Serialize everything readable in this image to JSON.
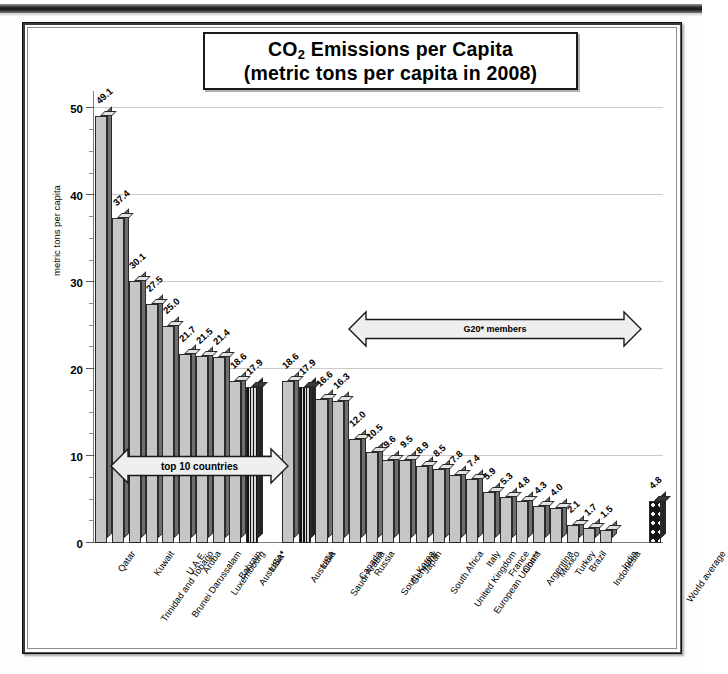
{
  "title": {
    "line1_prefix": "CO",
    "line1_sub": "2",
    "line1_suffix": " Emissions per Capita",
    "line2": "(metric tons per capita in 2008)"
  },
  "axis": {
    "y_title": "metric tons per capita",
    "y_ticks": [
      "0",
      "10",
      "20",
      "30",
      "40",
      "50"
    ]
  },
  "annotations": [
    {
      "id": "top10",
      "label": "top 10 countries"
    },
    {
      "id": "g20",
      "label": "G20* members"
    }
  ],
  "chart_data": {
    "type": "bar",
    "title": "CO2 Emissions per Capita (metric tons per capita in 2008)",
    "xlabel": "",
    "ylabel": "metric tons per capita",
    "ylim": [
      0,
      52
    ],
    "ytick_step": 10,
    "grid": true,
    "legend": "none",
    "groups": [
      {
        "name": "top 10 countries",
        "categories": [
          "Qatar",
          "Trinidad and Tobago",
          "Kuwait",
          "Brunei Darussalam",
          "U.A.E.",
          "Aruba",
          "Luxembourg",
          "Bahrain",
          "Australia*",
          "USA*"
        ],
        "values": [
          49.1,
          37.4,
          30.1,
          27.5,
          25.0,
          21.7,
          21.5,
          21.4,
          18.6,
          17.9
        ],
        "highlight": [
          "USA*"
        ]
      },
      {
        "name": "G20* members",
        "categories": [
          "Australia",
          "USA",
          "Saudi Arabia",
          "Canada",
          "Russia",
          "South Korea",
          "Germany",
          "Japan",
          "South Africa",
          "United Kingdom",
          "European Union**",
          "Italy",
          "France",
          "China",
          "Argentina",
          "Mexico",
          "Turkey",
          "Brazil",
          "Indonesia",
          "India"
        ],
        "values": [
          18.6,
          17.9,
          16.6,
          16.3,
          12.0,
          10.5,
          9.6,
          9.5,
          8.9,
          8.5,
          7.8,
          7.4,
          5.9,
          5.3,
          4.8,
          4.3,
          4.0,
          2.1,
          1.7,
          1.5
        ],
        "highlight": [
          "USA"
        ]
      },
      {
        "name": "reference",
        "categories": [
          "World average"
        ],
        "values": [
          4.8
        ],
        "highlight": [
          "World average"
        ]
      }
    ]
  },
  "colors": {
    "bar_face": "#c6c6c6",
    "bar_side": "#6f6f6f",
    "bar_top": "#e2e2e2",
    "highlight_face": "#2e2e2e",
    "reference_face": "#141414",
    "grid": "#c9c9c9",
    "text": "#000000"
  }
}
